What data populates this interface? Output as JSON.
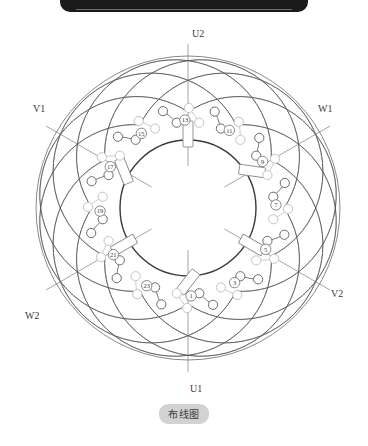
{
  "figure": {
    "caption": "布线图",
    "center": {
      "x": 188,
      "y": 208
    },
    "radii": {
      "bore": 68,
      "slot_ring": 74,
      "inner_conductor": 86,
      "outer_conductor": 100,
      "endturn_min": 96,
      "endturn_max": 150,
      "outline": 152
    }
  },
  "terminals": [
    {
      "id": "U2",
      "label": "U2",
      "angle_deg": 90,
      "x": 192,
      "y": 37,
      "line": true
    },
    {
      "id": "U1",
      "label": "U1",
      "angle_deg": 270,
      "x": 190,
      "y": 392,
      "line": true
    },
    {
      "id": "V1",
      "label": "V1",
      "angle_deg": 150,
      "x": 33,
      "y": 112,
      "line": true
    },
    {
      "id": "V2",
      "label": "V2",
      "angle_deg": 330,
      "x": 331,
      "y": 297,
      "line": true
    },
    {
      "id": "W1",
      "label": "W1",
      "angle_deg": 30,
      "x": 318,
      "y": 112,
      "line": true
    },
    {
      "id": "W2",
      "label": "W2",
      "angle_deg": 210,
      "x": 25,
      "y": 319,
      "line": true
    }
  ],
  "slot_numbers": [
    {
      "label": "1",
      "angle_deg": 272
    },
    {
      "label": "3",
      "angle_deg": 302
    },
    {
      "label": "5",
      "angle_deg": 332
    },
    {
      "label": "7",
      "angle_deg": 2
    },
    {
      "label": "9",
      "angle_deg": 32
    },
    {
      "label": "11",
      "angle_deg": 62
    },
    {
      "label": "13",
      "angle_deg": 92
    },
    {
      "label": "15",
      "angle_deg": 122
    },
    {
      "label": "17",
      "angle_deg": 152
    },
    {
      "label": "19",
      "angle_deg": 182
    },
    {
      "label": "21",
      "angle_deg": 212
    },
    {
      "label": "23",
      "angle_deg": 242
    }
  ],
  "slot_markers_deg": [
    90,
    30,
    330,
    270,
    210,
    150
  ],
  "counts": {
    "slots": 24,
    "conductor_circles_per_ring": 24,
    "endturn_arcs_cw": 12,
    "endturn_arcs_ccw": 12
  },
  "colors": {
    "outline": "#8a8a8a",
    "bore": "#3a3a3a",
    "endturn_dark": "#555555",
    "endturn_light": "#b8b8b8",
    "conductor_dark": "#6b6b6b",
    "conductor_light": "#c4c4c4",
    "axis": "#8d8d8d",
    "text": "#3a3a3a",
    "pill_bg": "#d2d2d2",
    "topbar": "#1b1b1b"
  }
}
